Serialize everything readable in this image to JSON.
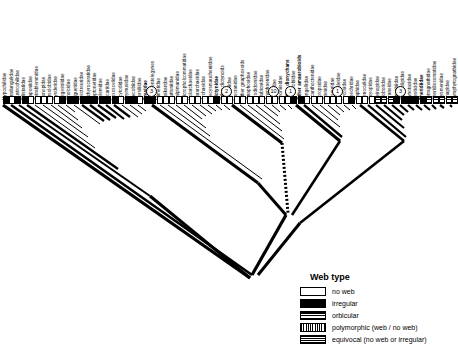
{
  "figure": {
    "type": "phylogenetic-cladogram",
    "title": "",
    "taxa_count": 72
  },
  "legend": {
    "title": "Web type",
    "items": [
      {
        "state": "no-web",
        "label": "no web",
        "swatch": "white"
      },
      {
        "state": "irregular",
        "label": "irregular",
        "swatch": "black"
      },
      {
        "state": "orbicular",
        "label": "orbicular",
        "swatch": "checkered"
      },
      {
        "state": "polymorphic",
        "label": "polymorphic (web / no web)",
        "swatch": "vertical-stripes"
      },
      {
        "state": "equivocal",
        "label": "equivocal (no web or irregular)",
        "swatch": "horizontal-stripes"
      }
    ]
  },
  "node_labels": [
    {
      "number": "3",
      "x": 146,
      "y": 86
    },
    {
      "number": "2",
      "x": 221,
      "y": 86
    },
    {
      "number": "10",
      "x": 268,
      "y": 86
    },
    {
      "number": "1",
      "x": 285,
      "y": 86
    },
    {
      "number": "1",
      "x": 332,
      "y": 86
    },
    {
      "number": "3",
      "x": 395,
      "y": 86
    }
  ],
  "taxa": [
    {
      "name": "Hypochilidae",
      "state": "irregular",
      "bold": false
    },
    {
      "name": "Gradungulidae",
      "state": "no-web",
      "bold": false
    },
    {
      "name": "Austrochilidae",
      "state": "irregular",
      "bold": false
    },
    {
      "name": "Filistatidae",
      "state": "irregular",
      "bold": false
    },
    {
      "name": "Caponiidae",
      "state": "no-web",
      "bold": false
    },
    {
      "name": "Tetrablemmidae",
      "state": "no-web",
      "bold": false
    },
    {
      "name": "Oonopidae",
      "state": "no-web",
      "bold": false
    },
    {
      "name": "Orsolobidae",
      "state": "no-web",
      "bold": false
    },
    {
      "name": "Dysderidae",
      "state": "no-web",
      "bold": false
    },
    {
      "name": "Segestriidae",
      "state": "irregular",
      "bold": false
    },
    {
      "name": "Pholcidae",
      "state": "irregular",
      "bold": false
    },
    {
      "name": "Diguetidae",
      "state": "irregular",
      "bold": false
    },
    {
      "name": "Plectreuridae",
      "state": "irregular",
      "bold": false
    },
    {
      "name": "Ochyroceratidae",
      "state": "irregular",
      "bold": false
    },
    {
      "name": "Leptonetidae",
      "state": "irregular",
      "bold": false
    },
    {
      "name": "Telemidae",
      "state": "irregular",
      "bold": false
    },
    {
      "name": "Sicariidae",
      "state": "irregular",
      "bold": false
    },
    {
      "name": "Loxoscelidae",
      "state": "irregular",
      "bold": false
    },
    {
      "name": "Scytodidae",
      "state": "no-web",
      "bold": false
    },
    {
      "name": "Drymusidae",
      "state": "irregular",
      "bold": false
    },
    {
      "name": "Oecobiidae",
      "state": "irregular",
      "bold": false
    },
    {
      "name": "Hersiliidae",
      "state": "no-web",
      "bold": false
    },
    {
      "name": "Eresidae",
      "state": "irregular",
      "bold": true
    },
    {
      "name": "Other entelegynes",
      "state": "irregular",
      "bold": false
    },
    {
      "name": "Mimetidae",
      "state": "no-web",
      "bold": false
    },
    {
      "name": "Malkaridae",
      "state": "no-web",
      "bold": false
    },
    {
      "name": "Huttoniidae",
      "state": "no-web",
      "bold": false
    },
    {
      "name": "Palpimanidae",
      "state": "no-web",
      "bold": false
    },
    {
      "name": "Micropholcommatidae",
      "state": "no-web",
      "bold": false
    },
    {
      "name": "Holarchaeidae",
      "state": "no-web",
      "bold": false
    },
    {
      "name": "Pararchaeidae",
      "state": "no-web",
      "bold": false
    },
    {
      "name": "Archaeidae",
      "state": "no-web",
      "bold": false
    },
    {
      "name": "Mecysmaucheniidae",
      "state": "no-web",
      "bold": false
    },
    {
      "name": "Dictynidae",
      "state": "irregular",
      "bold": true
    },
    {
      "name": "Other dictynoids",
      "state": "no-web",
      "bold": false
    },
    {
      "name": "Corinnidae",
      "state": "no-web",
      "bold": false
    },
    {
      "name": "Liocranidae",
      "state": "no-web",
      "bold": false
    },
    {
      "name": "Other gnaphosoids",
      "state": "no-web",
      "bold": false
    },
    {
      "name": "Gnaphosidae",
      "state": "no-web",
      "bold": false
    },
    {
      "name": "Prodidomidae",
      "state": "no-web",
      "bold": false
    },
    {
      "name": "Clubionidae",
      "state": "no-web",
      "bold": false
    },
    {
      "name": "Anyphaenidae",
      "state": "no-web",
      "bold": false
    },
    {
      "name": "Salticidae",
      "state": "no-web",
      "bold": false
    },
    {
      "name": "Thomisidae",
      "state": "no-web",
      "bold": false
    },
    {
      "name": "Other dionychans",
      "state": "no-web",
      "bold": true
    },
    {
      "name": "Amaurobiidae",
      "state": "irregular",
      "bold": false
    },
    {
      "name": "Other amaurobioids",
      "state": "irregular",
      "bold": true
    },
    {
      "name": "Tengellidae",
      "state": "no-web",
      "bold": false
    },
    {
      "name": "Acanthoctenidae",
      "state": "no-web",
      "bold": false
    },
    {
      "name": "Zoropsidae",
      "state": "no-web",
      "bold": false
    },
    {
      "name": "Ctenidae",
      "state": "no-web",
      "bold": false
    },
    {
      "name": "Pisauridae",
      "state": "no-web",
      "bold": false
    },
    {
      "name": "Trechaleidae",
      "state": "no-web",
      "bold": false
    },
    {
      "name": "Lycosidae",
      "state": "no-web",
      "bold": false
    },
    {
      "name": "Psechridae",
      "state": "irregular",
      "bold": false
    },
    {
      "name": "Saphidae",
      "state": "no-web",
      "bold": false
    },
    {
      "name": "Senoculidae",
      "state": "no-web",
      "bold": false
    },
    {
      "name": "Oxyopidae",
      "state": "no-web",
      "bold": false
    },
    {
      "name": "Deinopidae",
      "state": "orbicular",
      "bold": false
    },
    {
      "name": "Uloboridae",
      "state": "orbicular",
      "bold": false
    },
    {
      "name": "Araneidae",
      "state": "orbicular",
      "bold": false
    },
    {
      "name": "Linyphiidae",
      "state": "irregular",
      "bold": false
    },
    {
      "name": "Cyatholipidae",
      "state": "irregular",
      "bold": false
    },
    {
      "name": "Synotaxidae",
      "state": "irregular",
      "bold": false
    },
    {
      "name": "Nesticidae",
      "state": "irregular",
      "bold": false
    },
    {
      "name": "Theridiidae",
      "state": "irregular",
      "bold": true
    },
    {
      "name": "Tetragnathidae",
      "state": "orbicular",
      "bold": false
    },
    {
      "name": "Theridiosomatidae",
      "state": "orbicular",
      "bold": false
    },
    {
      "name": "Mysmenidae",
      "state": "orbicular",
      "bold": false
    },
    {
      "name": "Anapidae",
      "state": "orbicular",
      "bold": false
    },
    {
      "name": "Symphytognathidae",
      "state": "orbicular",
      "bold": false
    }
  ]
}
